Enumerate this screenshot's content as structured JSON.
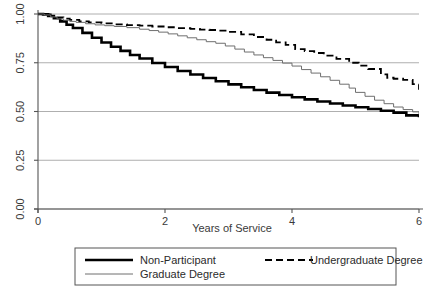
{
  "chart_data": {
    "type": "line",
    "title": "",
    "subtitle": "",
    "xlabel": "Years of Service",
    "ylabel": "",
    "xlim": [
      0,
      6
    ],
    "ylim": [
      0,
      1
    ],
    "xticks": [
      0,
      2,
      4,
      6
    ],
    "xtick_labels": [
      "0",
      "2",
      "4",
      "6"
    ],
    "yticks": [
      0,
      0.25,
      0.5,
      0.75,
      1
    ],
    "ytick_labels": [
      "0.00",
      "0.25",
      "0.50",
      "0.75",
      "1.00"
    ],
    "grid": "horizontal",
    "grid_color": "#9a9a9a",
    "axis_color": "#555555",
    "legend_position": "below-center",
    "legend_border_color": "#555555",
    "series": [
      {
        "name": "Non-Participant",
        "style": "solid-thick",
        "color": "#000000",
        "width": 2.6,
        "dash": "none",
        "x": [
          0,
          0.08,
          0.16,
          0.25,
          0.35,
          0.45,
          0.55,
          0.7,
          0.85,
          1.0,
          1.15,
          1.3,
          1.45,
          1.6,
          1.8,
          2.0,
          2.2,
          2.4,
          2.6,
          2.8,
          3.0,
          3.2,
          3.4,
          3.6,
          3.8,
          4.0,
          4.2,
          4.4,
          4.6,
          4.8,
          5.0,
          5.2,
          5.4,
          5.6,
          5.8,
          6.0
        ],
        "y": [
          1.0,
          0.998,
          0.99,
          0.978,
          0.962,
          0.945,
          0.928,
          0.903,
          0.878,
          0.854,
          0.832,
          0.811,
          0.79,
          0.772,
          0.749,
          0.728,
          0.708,
          0.69,
          0.672,
          0.655,
          0.639,
          0.624,
          0.61,
          0.597,
          0.585,
          0.573,
          0.562,
          0.551,
          0.541,
          0.531,
          0.522,
          0.513,
          0.504,
          0.494,
          0.48,
          0.47
        ]
      },
      {
        "name": "Undergraduate Degree",
        "style": "dashed",
        "color": "#000000",
        "width": 1.8,
        "dash": "7,4",
        "x": [
          0,
          0.1,
          0.2,
          0.3,
          0.4,
          0.5,
          0.65,
          0.8,
          1.0,
          1.2,
          1.4,
          1.6,
          1.8,
          2.0,
          2.2,
          2.4,
          2.55,
          2.7,
          2.85,
          3.0,
          3.2,
          3.4,
          3.6,
          3.75,
          3.9,
          4.05,
          4.2,
          4.35,
          4.5,
          4.7,
          4.9,
          5.05,
          5.2,
          5.4,
          5.5,
          5.6,
          5.75,
          5.9,
          6.0
        ],
        "y": [
          1.0,
          0.998,
          0.99,
          0.982,
          0.976,
          0.97,
          0.962,
          0.957,
          0.952,
          0.947,
          0.943,
          0.94,
          0.936,
          0.932,
          0.928,
          0.924,
          0.92,
          0.918,
          0.915,
          0.908,
          0.896,
          0.882,
          0.868,
          0.855,
          0.842,
          0.82,
          0.81,
          0.8,
          0.787,
          0.77,
          0.75,
          0.735,
          0.718,
          0.69,
          0.673,
          0.668,
          0.662,
          0.64,
          0.612
        ]
      },
      {
        "name": "Graduate Degree",
        "style": "solid-thin",
        "color": "#6e6e6e",
        "width": 1.0,
        "dash": "none",
        "x": [
          0,
          0.1,
          0.2,
          0.3,
          0.4,
          0.5,
          0.6,
          0.75,
          0.9,
          1.05,
          1.2,
          1.4,
          1.6,
          1.75,
          1.9,
          2.05,
          2.2,
          2.35,
          2.5,
          2.65,
          2.8,
          2.95,
          3.1,
          3.25,
          3.4,
          3.55,
          3.7,
          3.85,
          4.0,
          4.15,
          4.3,
          4.45,
          4.6,
          4.75,
          4.9,
          5.0,
          5.15,
          5.3,
          5.45,
          5.6,
          5.75,
          5.9,
          6.0
        ],
        "y": [
          1.0,
          0.995,
          0.985,
          0.975,
          0.968,
          0.962,
          0.957,
          0.95,
          0.944,
          0.94,
          0.936,
          0.93,
          0.922,
          0.915,
          0.907,
          0.898,
          0.888,
          0.878,
          0.868,
          0.858,
          0.85,
          0.836,
          0.82,
          0.805,
          0.79,
          0.776,
          0.762,
          0.748,
          0.733,
          0.715,
          0.697,
          0.678,
          0.66,
          0.64,
          0.62,
          0.598,
          0.578,
          0.558,
          0.54,
          0.523,
          0.51,
          0.498,
          0.485
        ]
      }
    ]
  },
  "legend": {
    "entries": [
      {
        "label": "Non-Participant",
        "series": "Non-Participant"
      },
      {
        "label": "Undergraduate Degree",
        "series": "Undergraduate Degree"
      },
      {
        "label": "Graduate Degree",
        "series": "Graduate Degree"
      }
    ]
  }
}
